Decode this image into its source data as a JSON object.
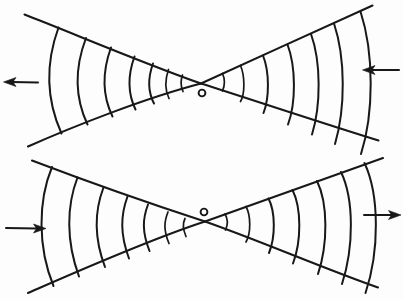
{
  "figure": {
    "background_color": "#fdfdfd",
    "ink_color": "#181818",
    "width": 403,
    "height": 300,
    "center_marker_label": "o"
  },
  "panels": [
    {
      "id": "top",
      "name": "top-bowtie",
      "crossing_point": [
        201,
        83
      ],
      "center_marker": {
        "cx": 202,
        "cy": 93,
        "r": 3.4
      },
      "rays": [
        {
          "name": "upper-left-ray",
          "from": [
            24,
            14
          ],
          "to": [
            201,
            83
          ]
        },
        {
          "name": "upper-right-ray",
          "from": [
            201,
            83
          ],
          "to": [
            372,
            5
          ]
        },
        {
          "name": "lower-left-ray",
          "from": [
            28,
            146
          ],
          "to": [
            201,
            83
          ]
        },
        {
          "name": "lower-right-ray",
          "from": [
            201,
            83
          ],
          "to": [
            378,
            140
          ]
        }
      ],
      "left_fan_arc_count": 7,
      "right_fan_arc_count": 7,
      "left_fan_bulge": "left",
      "right_fan_bulge": "right"
    },
    {
      "id": "bottom",
      "name": "bottom-bowtie",
      "crossing_point": [
        205,
        221
      ],
      "center_marker": {
        "cx": 204,
        "cy": 212,
        "r": 3.4
      },
      "rays": [
        {
          "name": "upper-left-ray",
          "from": [
            32,
            160
          ],
          "to": [
            205,
            221
          ]
        },
        {
          "name": "upper-right-ray",
          "from": [
            205,
            221
          ],
          "to": [
            383,
            158
          ]
        },
        {
          "name": "lower-left-ray",
          "from": [
            28,
            293
          ],
          "to": [
            205,
            221
          ]
        },
        {
          "name": "lower-right-ray",
          "from": [
            205,
            221
          ],
          "to": [
            378,
            287
          ]
        }
      ],
      "left_fan_arc_count": 7,
      "right_fan_arc_count": 7,
      "left_fan_bulge": "left",
      "right_fan_bulge": "right"
    }
  ],
  "arrows": [
    {
      "name": "top-left-arrow",
      "direction": "left",
      "tail": [
        38,
        82
      ],
      "tip": [
        4,
        82
      ]
    },
    {
      "name": "top-right-arrow",
      "direction": "left",
      "tail": [
        399,
        70
      ],
      "tip": [
        363,
        70
      ]
    },
    {
      "name": "bottom-left-arrow",
      "direction": "right",
      "tail": [
        6,
        228
      ],
      "tip": [
        46,
        228
      ]
    },
    {
      "name": "bottom-right-arrow",
      "direction": "right",
      "tail": [
        364,
        215
      ],
      "tip": [
        401,
        215
      ]
    }
  ]
}
